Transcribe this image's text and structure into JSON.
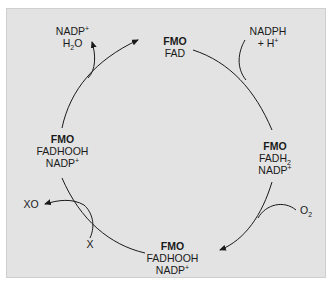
{
  "diagram": {
    "colors": {
      "panel": "#e3e3e3",
      "ink": "#1a1a1a",
      "border": "#cfcfcf"
    },
    "nodes": [
      {
        "id": "top",
        "line1": "FMO",
        "line2": "FAD"
      },
      {
        "id": "right",
        "line1": "FMO",
        "line2": "FADH",
        "line2_sub": "2",
        "line3": "NADP",
        "line3_sup": "+"
      },
      {
        "id": "bottom",
        "line1": "FMO",
        "line2": "FADHOOH",
        "line3": "NADP",
        "line3_sup": "+"
      },
      {
        "id": "left",
        "line1": "FMO",
        "line2": "FADHOOH",
        "line3": "NADP",
        "line3_sup": "+"
      }
    ],
    "side_species": {
      "nadph_in": {
        "line1": "NADPH",
        "line2": "+ H",
        "line2_sup": "+"
      },
      "nadp_h2o_out": {
        "line1": "NADP",
        "line1_sup": "+",
        "line2": "H",
        "line2_sub": "2",
        "line2_tail": "O"
      },
      "o2_in": {
        "text": "O",
        "sub": "2"
      },
      "x_in": {
        "text": "X"
      },
      "xo_out": {
        "text": "XO"
      }
    }
  }
}
